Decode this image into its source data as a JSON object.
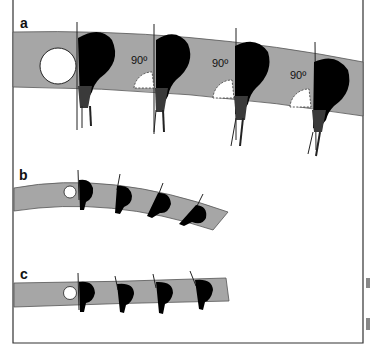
{
  "figure": {
    "panels": [
      {
        "id": "a",
        "label": "a",
        "angle_labels": [
          "90º",
          "90º",
          "90º"
        ],
        "flower_count": 4,
        "open_circle": true
      },
      {
        "id": "b",
        "label": "b",
        "flower_count": 4,
        "open_circle": true
      },
      {
        "id": "c",
        "label": "c",
        "flower_count": 4,
        "open_circle": true
      }
    ],
    "colors": {
      "band": "#a6a6a6",
      "band_edge": "#555555",
      "flower": "#000000",
      "stalk": "#3a3a3a",
      "frame": "#333333",
      "circle": "#ffffff"
    }
  }
}
